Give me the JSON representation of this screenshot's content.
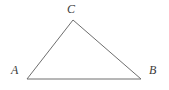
{
  "figure": {
    "name": "triangle-abc",
    "type": "geometry-diagram",
    "background_color": "#ffffff",
    "stroke_color": "#6e6e6e",
    "stroke_width": 1,
    "label_color": "#3a3a3a",
    "canvas": {
      "width": 169,
      "height": 90
    },
    "vertices": [
      {
        "id": "A",
        "label": "A",
        "x": 27,
        "y": 79,
        "label_x": 11,
        "label_y": 64
      },
      {
        "id": "B",
        "label": "B",
        "x": 141,
        "y": 79,
        "label_x": 149,
        "label_y": 64
      },
      {
        "id": "C",
        "label": "C",
        "x": 73,
        "y": 20,
        "label_x": 67,
        "label_y": 3
      }
    ],
    "edges": [
      {
        "id": "AC",
        "from": "A",
        "to": "C"
      },
      {
        "id": "CB",
        "from": "C",
        "to": "B"
      },
      {
        "id": "AB",
        "from": "A",
        "to": "B"
      }
    ],
    "polygon_points": "27,79 73,20 141,79"
  }
}
